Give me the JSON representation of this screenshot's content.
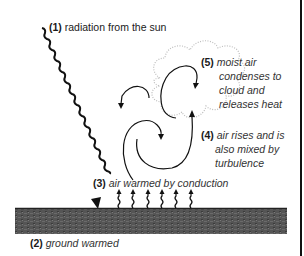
{
  "diagram": {
    "steps": [
      {
        "number": "(1)",
        "text": "radiation from the sun"
      },
      {
        "number": "(2)",
        "text": "ground warmed"
      },
      {
        "number": "(3)",
        "text": "air warmed by conduction"
      },
      {
        "number": "(4)",
        "lines": [
          "air rises and is",
          "also mixed by",
          "turbulence"
        ]
      },
      {
        "number": "(5)",
        "lines": [
          "moist air",
          "condenses to",
          "cloud and",
          "releases heat"
        ]
      }
    ],
    "colors": {
      "line": "#111111",
      "ground": "#4a4a4a",
      "cloud_outline": "#bdbdbd",
      "text": "#1a1a1a"
    }
  }
}
